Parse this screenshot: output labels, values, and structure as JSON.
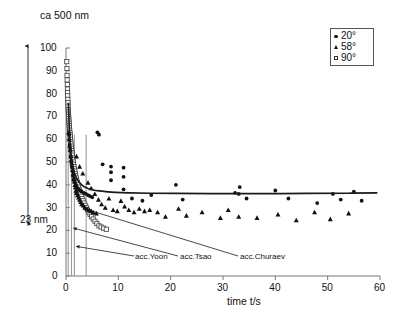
{
  "chart_data": {
    "type": "scatter",
    "title": "ca 500 nm",
    "xlabel": "time t/s",
    "ylabel": "",
    "xlim": [
      0,
      60
    ],
    "ylim": [
      0,
      100
    ],
    "xticks": [
      0,
      10,
      20,
      30,
      40,
      50,
      60
    ],
    "yticks": [
      0,
      10,
      20,
      30,
      40,
      50,
      60,
      70,
      80,
      90,
      100
    ],
    "grid": false,
    "legend_position": "top-right",
    "legend": [
      {
        "label": "20°",
        "marker": "filled-circle"
      },
      {
        "label": "58°",
        "marker": "filled-triangle"
      },
      {
        "label": "90°",
        "marker": "open-square"
      }
    ],
    "series": [
      {
        "name": "20°",
        "marker": "filled-circle",
        "points": [
          [
            0.6,
            62.0
          ],
          [
            0.7,
            57.5
          ],
          [
            0.8,
            55.0
          ],
          [
            0.9,
            52.0
          ],
          [
            1.0,
            50.0
          ],
          [
            1.1,
            48.0
          ],
          [
            1.2,
            46.0
          ],
          [
            1.3,
            44.0
          ],
          [
            1.5,
            42.0
          ],
          [
            1.7,
            41.0
          ],
          [
            1.9,
            40.0
          ],
          [
            2.1,
            39.0
          ],
          [
            2.4,
            38.0
          ],
          [
            2.7,
            37.5
          ],
          [
            3.0,
            37.0
          ],
          [
            3.4,
            36.5
          ],
          [
            3.8,
            36.0
          ],
          [
            4.2,
            35.5
          ],
          [
            4.6,
            35.0
          ],
          [
            5.0,
            34.5
          ],
          [
            6.0,
            63.0
          ],
          [
            6.3,
            62.0
          ],
          [
            7.0,
            49.0
          ],
          [
            8.6,
            48.0
          ],
          [
            8.6,
            45.5
          ],
          [
            8.6,
            42.0
          ],
          [
            11.0,
            47.5
          ],
          [
            11.0,
            43.5
          ],
          [
            11.0,
            38.0
          ],
          [
            12.6,
            34.0
          ],
          [
            14.6,
            33.0
          ],
          [
            16.3,
            35.5
          ],
          [
            21.0,
            40.0
          ],
          [
            22.3,
            33.5
          ],
          [
            32.3,
            36.5
          ],
          [
            33.0,
            36.0
          ],
          [
            33.2,
            39.0
          ],
          [
            34.5,
            34.0
          ],
          [
            40.0,
            37.5
          ],
          [
            42.5,
            34.0
          ],
          [
            48.0,
            32.0
          ],
          [
            51.0,
            36.0
          ],
          [
            52.5,
            33.5
          ],
          [
            55.0,
            37.0
          ],
          [
            56.5,
            33.0
          ]
        ]
      },
      {
        "name": "58°",
        "marker": "filled-triangle",
        "points": [
          [
            0.5,
            63.0
          ],
          [
            0.6,
            60.0
          ],
          [
            0.7,
            57.0
          ],
          [
            0.8,
            55.5
          ],
          [
            0.9,
            53.0
          ],
          [
            1.0,
            51.0
          ],
          [
            1.1,
            49.5
          ],
          [
            1.2,
            48.0
          ],
          [
            1.3,
            46.5
          ],
          [
            1.4,
            45.0
          ],
          [
            1.5,
            43.0
          ],
          [
            1.6,
            41.5
          ],
          [
            1.7,
            40.0
          ],
          [
            1.8,
            39.0
          ],
          [
            1.9,
            37.5
          ],
          [
            2.0,
            36.5
          ],
          [
            2.2,
            35.5
          ],
          [
            2.4,
            34.5
          ],
          [
            2.6,
            33.5
          ],
          [
            2.8,
            32.5
          ],
          [
            3.0,
            31.5
          ],
          [
            3.3,
            31.0
          ],
          [
            3.6,
            30.0
          ],
          [
            4.0,
            29.5
          ],
          [
            4.4,
            29.0
          ],
          [
            4.8,
            28.5
          ],
          [
            5.2,
            28.0
          ],
          [
            5.8,
            27.5
          ],
          [
            2.0,
            52.5
          ],
          [
            2.6,
            48.0
          ],
          [
            3.2,
            45.0
          ],
          [
            4.2,
            41.0
          ],
          [
            4.8,
            38.5
          ],
          [
            5.5,
            36.0
          ],
          [
            6.2,
            33.5
          ],
          [
            6.8,
            31.5
          ],
          [
            7.5,
            30.0
          ],
          [
            8.2,
            34.0
          ],
          [
            9.0,
            29.0
          ],
          [
            9.8,
            28.5
          ],
          [
            10.5,
            33.0
          ],
          [
            11.2,
            30.5
          ],
          [
            12.0,
            29.0
          ],
          [
            13.0,
            28.0
          ],
          [
            14.0,
            29.5
          ],
          [
            15.0,
            28.5
          ],
          [
            16.0,
            29.0
          ],
          [
            17.5,
            28.0
          ],
          [
            19.0,
            26.0
          ],
          [
            21.5,
            29.5
          ],
          [
            23.0,
            26.5
          ],
          [
            26.0,
            28.0
          ],
          [
            29.5,
            25.5
          ],
          [
            31.0,
            29.0
          ],
          [
            33.0,
            26.0
          ],
          [
            36.5,
            25.5
          ],
          [
            40.5,
            27.0
          ],
          [
            44.0,
            24.5
          ],
          [
            47.5,
            28.0
          ],
          [
            50.5,
            25.0
          ],
          [
            54.0,
            27.5
          ]
        ]
      },
      {
        "name": "90°",
        "marker": "open-square",
        "points": [
          [
            0.15,
            94.0
          ],
          [
            0.18,
            91.0
          ],
          [
            0.2,
            88.0
          ],
          [
            0.22,
            86.0
          ],
          [
            0.25,
            84.0
          ],
          [
            0.28,
            82.0
          ],
          [
            0.3,
            80.5
          ],
          [
            0.32,
            79.0
          ],
          [
            0.35,
            77.5
          ],
          [
            0.38,
            76.0
          ],
          [
            0.4,
            74.5
          ],
          [
            0.42,
            73.0
          ],
          [
            0.45,
            72.0
          ],
          [
            0.48,
            71.0
          ],
          [
            0.5,
            70.0
          ],
          [
            0.53,
            69.0
          ],
          [
            0.56,
            68.0
          ],
          [
            0.6,
            67.0
          ],
          [
            0.63,
            66.0
          ],
          [
            0.66,
            65.0
          ],
          [
            0.7,
            64.0
          ],
          [
            0.74,
            63.0
          ],
          [
            0.78,
            62.0
          ],
          [
            0.82,
            61.0
          ],
          [
            0.86,
            60.0
          ],
          [
            0.9,
            59.0
          ],
          [
            0.95,
            58.0
          ],
          [
            1.0,
            57.0
          ],
          [
            1.05,
            56.0
          ],
          [
            1.1,
            55.0
          ],
          [
            1.15,
            54.0
          ],
          [
            1.2,
            53.0
          ],
          [
            1.26,
            52.0
          ],
          [
            1.32,
            51.0
          ],
          [
            1.38,
            50.0
          ],
          [
            1.45,
            49.0
          ],
          [
            1.52,
            48.0
          ],
          [
            1.6,
            47.0
          ],
          [
            1.68,
            46.0
          ],
          [
            1.76,
            45.0
          ],
          [
            1.85,
            44.0
          ],
          [
            1.95,
            43.0
          ],
          [
            2.05,
            42.0
          ],
          [
            2.15,
            41.0
          ],
          [
            2.26,
            40.0
          ],
          [
            2.38,
            39.0
          ],
          [
            2.5,
            38.0
          ],
          [
            2.64,
            37.0
          ],
          [
            2.78,
            36.0
          ],
          [
            2.94,
            35.0
          ],
          [
            3.1,
            34.0
          ],
          [
            3.28,
            33.0
          ],
          [
            3.46,
            32.0
          ],
          [
            3.66,
            31.0
          ],
          [
            3.88,
            30.0
          ],
          [
            4.1,
            29.0
          ],
          [
            4.35,
            28.0
          ],
          [
            4.6,
            27.0
          ],
          [
            4.9,
            26.0
          ],
          [
            5.2,
            25.0
          ],
          [
            5.55,
            24.0
          ],
          [
            5.9,
            23.0
          ],
          [
            6.3,
            22.0
          ],
          [
            6.7,
            21.5
          ],
          [
            7.2,
            21.0
          ],
          [
            7.7,
            20.5
          ]
        ]
      }
    ],
    "fit_curve": {
      "name": "model-fit",
      "points": [
        [
          0.45,
          76.0
        ],
        [
          0.55,
          70.0
        ],
        [
          0.65,
          64.5
        ],
        [
          0.75,
          60.0
        ],
        [
          0.9,
          55.0
        ],
        [
          1.05,
          51.5
        ],
        [
          1.25,
          48.5
        ],
        [
          1.5,
          46.0
        ],
        [
          1.8,
          44.0
        ],
        [
          2.1,
          42.5
        ],
        [
          2.5,
          41.2
        ],
        [
          3.0,
          40.0
        ],
        [
          3.6,
          39.0
        ],
        [
          4.3,
          38.3
        ],
        [
          5.2,
          37.7
        ],
        [
          6.3,
          37.3
        ],
        [
          7.6,
          37.0
        ],
        [
          9.5,
          36.7
        ],
        [
          12.0,
          36.5
        ],
        [
          16.0,
          36.3
        ],
        [
          21.0,
          36.2
        ],
        [
          28.0,
          36.1
        ],
        [
          36.0,
          36.1
        ],
        [
          46.0,
          36.2
        ],
        [
          54.0,
          36.3
        ],
        [
          59.5,
          36.5
        ]
      ]
    },
    "vertical_markers": [
      {
        "label": "acc.Churaev",
        "t": 0.42
      },
      {
        "label": "acc.Tsao",
        "t": 1.05
      },
      {
        "label": "acc.Yoon",
        "t": 1.6
      },
      {
        "label": "",
        "t": 3.85
      }
    ],
    "annotations": [
      {
        "name": "film-thickness-title",
        "text": "ca 500 nm"
      },
      {
        "name": "thickness-range-label",
        "text": "23 nm"
      },
      {
        "name": "leader-label-yoon",
        "text": "acc.Yoon"
      },
      {
        "name": "leader-label-tsao",
        "text": "acc.Tsao"
      },
      {
        "name": "leader-label-churaev",
        "text": "acc.Churaev"
      }
    ],
    "range_arrow": {
      "from_value": 100,
      "to_value": 23,
      "label": "23 nm"
    }
  }
}
